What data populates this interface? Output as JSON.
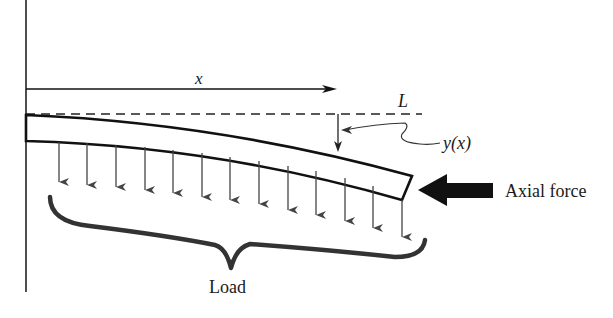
{
  "figure": {
    "labels": {
      "x": "x",
      "length": "L",
      "deflection": "y(x)",
      "axial_force": "Axial force",
      "load": "Load"
    },
    "load_arrow_count": 13,
    "colors": {
      "line": "#111111",
      "arrow": "#444444",
      "brace": "#333333",
      "background": "#ffffff"
    }
  }
}
